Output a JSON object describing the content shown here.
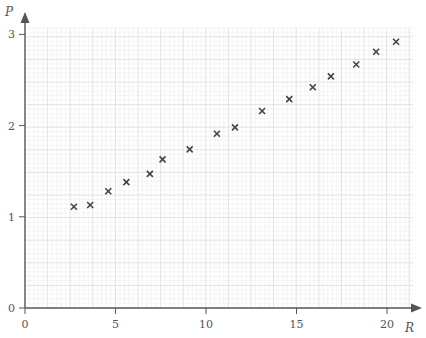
{
  "chart_data": {
    "type": "scatter",
    "title": "",
    "xlabel": "R",
    "ylabel": "P",
    "xlim": [
      0,
      21.3
    ],
    "ylim": [
      0,
      3.05
    ],
    "xticks": [
      0,
      5,
      10,
      15,
      20
    ],
    "xtick_labels": [
      "0",
      "5",
      "10",
      "15",
      "20"
    ],
    "yticks": [
      0,
      1,
      2,
      3
    ],
    "ytick_labels": [
      "0",
      "1",
      "2",
      "3"
    ],
    "grid": true,
    "legend": null,
    "marker": "x",
    "series": [
      {
        "name": "data",
        "points": [
          {
            "x": 2.7,
            "y": 1.11
          },
          {
            "x": 3.6,
            "y": 1.13
          },
          {
            "x": 4.6,
            "y": 1.28
          },
          {
            "x": 5.6,
            "y": 1.38
          },
          {
            "x": 6.9,
            "y": 1.47
          },
          {
            "x": 7.6,
            "y": 1.63
          },
          {
            "x": 9.1,
            "y": 1.74
          },
          {
            "x": 10.6,
            "y": 1.91
          },
          {
            "x": 11.6,
            "y": 1.98
          },
          {
            "x": 13.1,
            "y": 2.16
          },
          {
            "x": 14.6,
            "y": 2.29
          },
          {
            "x": 15.9,
            "y": 2.42
          },
          {
            "x": 16.9,
            "y": 2.54
          },
          {
            "x": 18.3,
            "y": 2.67
          },
          {
            "x": 19.4,
            "y": 2.81
          },
          {
            "x": 20.5,
            "y": 2.92
          }
        ]
      }
    ]
  },
  "colors": {
    "axis": "#555555",
    "marker": "#444444",
    "grid_major": "#dcdcdc",
    "grid_minor": "#efefef"
  }
}
